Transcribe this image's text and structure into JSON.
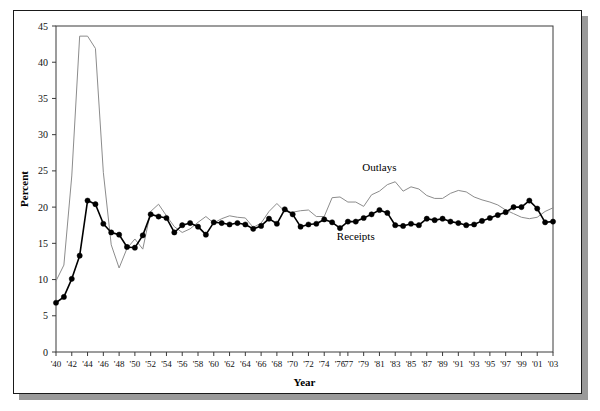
{
  "chart_data": {
    "type": "line",
    "title": "",
    "xlabel": "Year",
    "ylabel": "Percent",
    "xlim": [
      1940,
      2003
    ],
    "ylim": [
      0,
      45
    ],
    "ytick_values": [
      0,
      5,
      10,
      15,
      20,
      25,
      30,
      35,
      40,
      45
    ],
    "ytick_labels": [
      "0",
      "5",
      "10",
      "15",
      "20",
      "25",
      "30",
      "35",
      "40",
      "45"
    ],
    "xtick_values": [
      1940,
      1942,
      1944,
      1946,
      1948,
      1950,
      1952,
      1954,
      1956,
      1958,
      1960,
      1962,
      1964,
      1966,
      1968,
      1970,
      1972,
      1974,
      1976,
      1977,
      1979,
      1981,
      1983,
      1985,
      1987,
      1989,
      1991,
      1993,
      1995,
      1997,
      1999,
      2001,
      2003
    ],
    "xtick_labels": [
      "'40",
      "'42",
      "'44",
      "'46",
      "'48",
      "'50",
      "'52",
      "'54",
      "'56",
      "'58",
      "'60",
      "'62",
      "'64",
      "'66",
      "'68",
      "'70",
      "'72",
      "'74",
      "'76",
      "'77",
      "'79",
      "'81",
      "'83",
      "'85",
      "'87",
      "'89",
      "'91",
      "'93",
      "'95",
      "'97",
      "'99",
      "'01",
      "'03"
    ],
    "grid": false,
    "legend_position": "inline-annotation",
    "annotations": [
      {
        "text": "Outlays",
        "x": 1981,
        "y": 25.0
      },
      {
        "text": "Receipts",
        "x": 1978,
        "y": 15.4
      }
    ],
    "x": [
      1940,
      1941,
      1942,
      1943,
      1944,
      1945,
      1946,
      1947,
      1948,
      1949,
      1950,
      1951,
      1952,
      1953,
      1954,
      1955,
      1956,
      1957,
      1958,
      1959,
      1960,
      1961,
      1962,
      1963,
      1964,
      1965,
      1966,
      1967,
      1968,
      1969,
      1970,
      1971,
      1972,
      1973,
      1974,
      1975,
      1976,
      1977,
      1978,
      1979,
      1980,
      1981,
      1982,
      1983,
      1984,
      1985,
      1986,
      1987,
      1988,
      1989,
      1990,
      1991,
      1992,
      1993,
      1994,
      1995,
      1996,
      1997,
      1998,
      1999,
      2000,
      2001,
      2002,
      2003
    ],
    "series": [
      {
        "name": "Outlays",
        "color": "#8c8c8c",
        "marker": "none",
        "values": [
          9.8,
          12.0,
          24.3,
          43.6,
          43.6,
          41.9,
          24.8,
          14.8,
          11.6,
          14.3,
          15.6,
          14.2,
          19.4,
          20.4,
          18.8,
          17.3,
          16.5,
          17.0,
          17.9,
          18.7,
          17.8,
          18.4,
          18.8,
          18.6,
          18.5,
          17.2,
          17.8,
          19.4,
          20.5,
          19.4,
          19.3,
          19.5,
          19.6,
          18.7,
          18.7,
          21.3,
          21.4,
          20.7,
          20.7,
          20.1,
          21.7,
          22.2,
          23.1,
          23.5,
          22.2,
          22.8,
          22.5,
          21.6,
          21.2,
          21.2,
          21.9,
          22.3,
          22.1,
          21.4,
          21.0,
          20.7,
          20.3,
          19.6,
          19.1,
          18.6,
          18.4,
          18.6,
          19.4,
          19.9
        ]
      },
      {
        "name": "Receipts",
        "color": "#000000",
        "marker": "circle",
        "values": [
          6.8,
          7.6,
          10.1,
          13.3,
          20.9,
          20.4,
          17.7,
          16.5,
          16.2,
          14.5,
          14.4,
          16.1,
          19.0,
          18.7,
          18.5,
          16.5,
          17.5,
          17.8,
          17.3,
          16.2,
          17.9,
          17.8,
          17.6,
          17.8,
          17.6,
          17.0,
          17.4,
          18.4,
          17.7,
          19.7,
          19.0,
          17.3,
          17.6,
          17.7,
          18.3,
          17.9,
          17.1,
          18.0,
          18.0,
          18.5,
          19.0,
          19.6,
          19.2,
          17.5,
          17.4,
          17.7,
          17.5,
          18.4,
          18.2,
          18.4,
          18.0,
          17.8,
          17.5,
          17.6,
          18.1,
          18.5,
          18.9,
          19.3,
          20.0,
          20.0,
          20.9,
          19.8,
          17.9,
          18.0
        ]
      }
    ]
  },
  "figure": {
    "background_color": "#ffffff",
    "frame_color": "#1a1a1a",
    "shadow_color": "#9a9a9a"
  }
}
